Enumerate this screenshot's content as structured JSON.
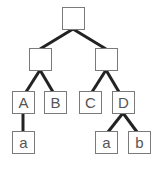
{
  "diagram": {
    "type": "tree",
    "edge_color": "#222222",
    "border_color": "#7a7a7a",
    "nodes": [
      {
        "id": "root",
        "label": "",
        "x": 62,
        "y": 7
      },
      {
        "id": "left",
        "label": "",
        "x": 29,
        "y": 48
      },
      {
        "id": "right",
        "label": "",
        "x": 95,
        "y": 48
      },
      {
        "id": "A",
        "label": "A",
        "x": 12,
        "y": 91
      },
      {
        "id": "B",
        "label": "B",
        "x": 44,
        "y": 91
      },
      {
        "id": "C",
        "label": "C",
        "x": 79,
        "y": 91
      },
      {
        "id": "D",
        "label": "D",
        "x": 112,
        "y": 91
      },
      {
        "id": "A_a",
        "label": "a",
        "x": 12,
        "y": 131
      },
      {
        "id": "D_a",
        "label": "a",
        "x": 95,
        "y": 131
      },
      {
        "id": "D_b",
        "label": "b",
        "x": 128,
        "y": 131
      }
    ],
    "edges": [
      [
        "root",
        "left"
      ],
      [
        "root",
        "right"
      ],
      [
        "left",
        "A"
      ],
      [
        "left",
        "B"
      ],
      [
        "right",
        "C"
      ],
      [
        "right",
        "D"
      ],
      [
        "A",
        "A_a"
      ],
      [
        "D",
        "D_a"
      ],
      [
        "D",
        "D_b"
      ]
    ]
  }
}
